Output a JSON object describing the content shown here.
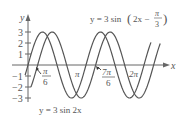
{
  "chart_data": {
    "type": "line",
    "title": "",
    "xlabel": "x",
    "ylabel": "y",
    "ylim": [
      -3,
      3
    ],
    "xlim": [
      0,
      2.2
    ],
    "x_unit": "pi",
    "y_ticks": [
      "3",
      "2",
      "1",
      "-1",
      "-2",
      "-3"
    ],
    "x_tick_labels": [
      {
        "label": "π/6",
        "x_over_pi": 0.1667,
        "arrow": true
      },
      {
        "label": "π",
        "x_over_pi": 1.0
      },
      {
        "label": "7π/6",
        "x_over_pi": 1.1667,
        "arrow": true
      },
      {
        "label": "2π",
        "x_over_pi": 2.0
      }
    ],
    "series": [
      {
        "name": "y = 3 sin 2x",
        "amplitude": 3,
        "frequency": 2,
        "phase": 0
      },
      {
        "name": "y = 3 sin(2x − π/3)",
        "amplitude": 3,
        "frequency": 2,
        "phase": -1.0472
      }
    ],
    "annotations": [
      "y = 3 sin 2x",
      "y = 3 sin(2x − π/3)"
    ],
    "grid": false,
    "legend": "none"
  },
  "labels": {
    "y_axis": "y",
    "x_axis": "x",
    "t3": "3",
    "t2": "2",
    "t1": "1",
    "tm1": "−1",
    "tm2": "−2",
    "tm3": "−3",
    "pi_num": "π",
    "six": "6",
    "pi": "π",
    "seven_pi": "7π",
    "six_b": "6",
    "two_pi": "2π",
    "curve1": "y = 3 sin 2x",
    "curve2_pre": "y = 3 sin",
    "curve2_arg": "2x −",
    "curve2_pi": "π",
    "curve2_3": "3"
  }
}
